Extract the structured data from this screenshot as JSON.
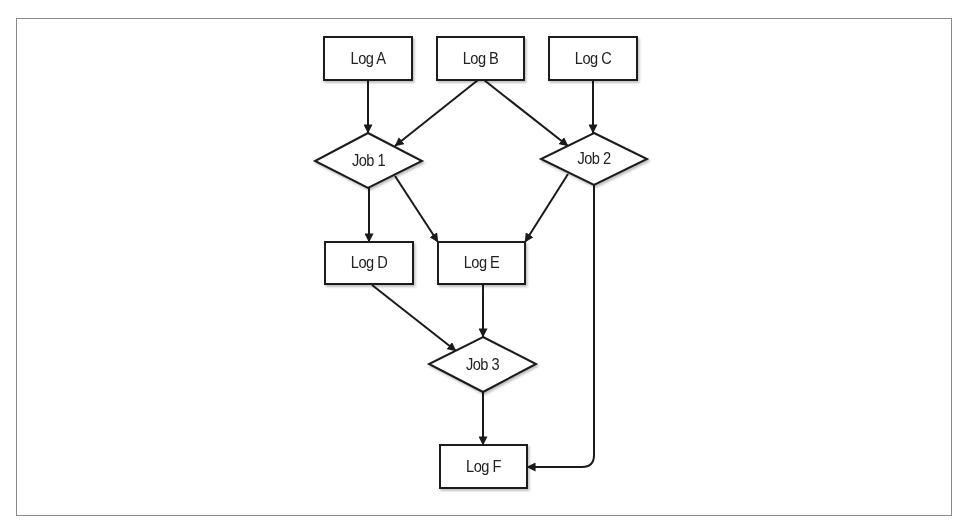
{
  "diagram": {
    "colors": {
      "stroke": "#1a1a1a",
      "frame": "#8a8a8a",
      "fill": "#ffffff",
      "text": "#222222"
    },
    "nodes": {
      "log_a": {
        "label": "Log A",
        "shape": "rect"
      },
      "log_b": {
        "label": "Log B",
        "shape": "rect"
      },
      "log_c": {
        "label": "Log C",
        "shape": "rect"
      },
      "job_1": {
        "label": "Job 1",
        "shape": "diamond"
      },
      "job_2": {
        "label": "Job 2",
        "shape": "diamond"
      },
      "log_d": {
        "label": "Log D",
        "shape": "rect"
      },
      "log_e": {
        "label": "Log E",
        "shape": "rect"
      },
      "job_3": {
        "label": "Job 3",
        "shape": "diamond"
      },
      "log_f": {
        "label": "Log F",
        "shape": "rect"
      }
    },
    "edges": [
      {
        "from": "Log A",
        "to": "Job 1"
      },
      {
        "from": "Log B",
        "to": "Job 1"
      },
      {
        "from": "Log B",
        "to": "Job 2"
      },
      {
        "from": "Log C",
        "to": "Job 2"
      },
      {
        "from": "Job 1",
        "to": "Log D"
      },
      {
        "from": "Job 1",
        "to": "Log E"
      },
      {
        "from": "Job 2",
        "to": "Log E"
      },
      {
        "from": "Job 2",
        "to": "Log F"
      },
      {
        "from": "Log D",
        "to": "Job 3"
      },
      {
        "from": "Log E",
        "to": "Job 3"
      },
      {
        "from": "Job 3",
        "to": "Log F"
      }
    ]
  }
}
